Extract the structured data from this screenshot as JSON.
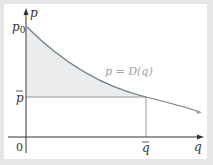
{
  "diagram": {
    "axes": {
      "y_label": "p",
      "x_label": "q",
      "origin_label": "0"
    },
    "labels": {
      "p0": "p",
      "p0_sub": "0",
      "p_bar": "p",
      "q_bar": "q",
      "curve": "p = D(q)"
    },
    "colors": {
      "frame": "#e6e6e6",
      "background": "#ffffff",
      "axis": "#333333",
      "curve": "#6f7f86",
      "shade": "#ebecee",
      "guide": "#8a8f93",
      "curve_label": "#9aa3a8"
    }
  }
}
